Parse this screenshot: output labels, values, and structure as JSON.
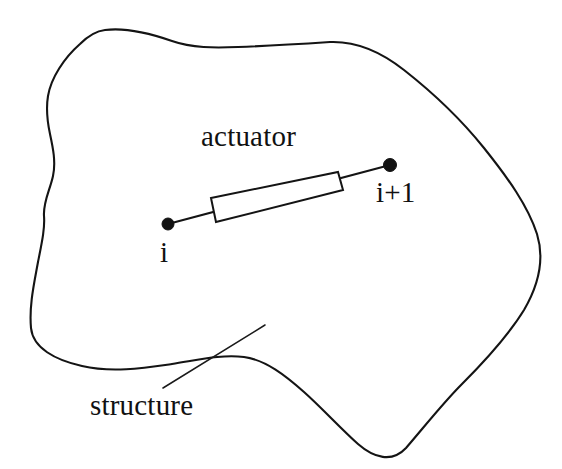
{
  "figure": {
    "background_color": "#ffffff",
    "ink_color": "#141414",
    "width": 562,
    "height": 469,
    "labels": {
      "actuator": "actuator",
      "node_start": "i",
      "node_end": "i+1",
      "structure": "structure"
    },
    "elements": {
      "structure_outline_name": "structure-outline",
      "actuator_body_name": "actuator-body",
      "member_line_name": "actuator-member-line",
      "node_start_name": "node-i-dot",
      "node_end_name": "node-i-plus-1-dot",
      "leader_name": "structure-leader-line"
    },
    "geometry": {
      "node_i": [
        168,
        224
      ],
      "node_i_plus_1": [
        390,
        165
      ],
      "node_radius": 6,
      "actuator_rect_corners": [
        [
          211,
          198
        ],
        [
          338,
          172
        ],
        [
          343,
          190
        ],
        [
          216,
          222
        ]
      ],
      "leader_line": [
        [
          163,
          388
        ],
        [
          265,
          325
        ]
      ],
      "outline_extremes": {
        "top_peak": [
          105,
          30
        ],
        "right_max": [
          540,
          240
        ],
        "bottom_valley": [
          405,
          450
        ],
        "left_min": [
          32,
          330
        ]
      }
    }
  }
}
